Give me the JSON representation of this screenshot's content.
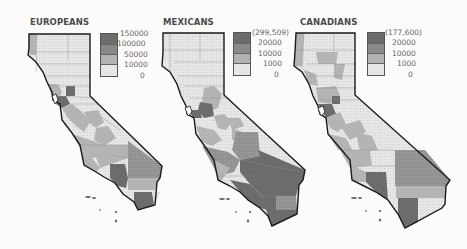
{
  "figure": {
    "panels": [
      {
        "title": "EUROPEANS",
        "legend": {
          "labels": [
            "150000",
            "100000",
            "50000",
            "10000",
            "0"
          ],
          "classes": [
            "100000–150000",
            "50000–100000",
            "10000–50000",
            "0–10000"
          ]
        }
      },
      {
        "title": "MEXICANS",
        "legend": {
          "labels": [
            "(299,509)",
            "20000",
            "10000",
            "1000",
            "0"
          ],
          "classes": [
            "20000–299,509",
            "10000–20000",
            "1000–10000",
            "0–1000"
          ]
        }
      },
      {
        "title": "CANADIANS",
        "legend": {
          "labels": [
            "(177,600)",
            "20000",
            "10000",
            "1000",
            "0"
          ],
          "classes": [
            "20000–177,600",
            "10000–20000",
            "1000–10000",
            "0–1000"
          ]
        }
      }
    ]
  },
  "colors": {
    "class_1": "#e4e4e2",
    "class_2": "#b2b2b0",
    "class_3": "#8e8e8c",
    "class_4": "#6c6c6a",
    "outline": "#1a1a1a",
    "county_line": "#8a8a88"
  }
}
